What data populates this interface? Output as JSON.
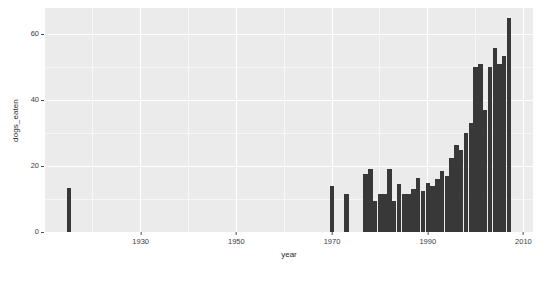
{
  "chart_data": {
    "type": "bar",
    "title": "",
    "subtitle": "",
    "xlabel": "year",
    "ylabel": "dogs_eaten",
    "xlim": [
      1910,
      2012
    ],
    "ylim": [
      0,
      68
    ],
    "grid": true,
    "legend": null,
    "panel_background": "#ebebeb",
    "bar_color": "#383838",
    "gridline_color": "#ffffff",
    "xticks": [
      1930,
      1950,
      1970,
      1990,
      2010
    ],
    "xtick_labels": [
      "1930",
      "1950",
      "1970",
      "1990",
      "2010"
    ],
    "yticks": [
      0,
      20,
      40,
      60
    ],
    "ytick_labels": [
      "0",
      "20",
      "40",
      "60"
    ],
    "x": [
      1915,
      1970,
      1973,
      1977,
      1978,
      1979,
      1980,
      1981,
      1982,
      1983,
      1984,
      1985,
      1986,
      1987,
      1988,
      1989,
      1990,
      1991,
      1992,
      1993,
      1994,
      1995,
      1996,
      1997,
      1998,
      1999,
      2000,
      2001,
      2002,
      2003,
      2004,
      2005,
      2006,
      2007
    ],
    "values": [
      13.5,
      14.0,
      11.5,
      17.5,
      19.0,
      9.5,
      11.5,
      11.5,
      19.0,
      9.5,
      14.5,
      11.5,
      11.5,
      13.0,
      16.5,
      12.5,
      15.0,
      14.0,
      16.0,
      18.5,
      17.0,
      22.5,
      26.5,
      25.0,
      30.0,
      33.0,
      50.0,
      51.0,
      37.0,
      50.0,
      56.0,
      51.0,
      53.5,
      65.0
    ],
    "categories": [
      "1915",
      "1970",
      "1973",
      "1977",
      "1978",
      "1979",
      "1980",
      "1981",
      "1982",
      "1983",
      "1984",
      "1985",
      "1986",
      "1987",
      "1988",
      "1989",
      "1990",
      "1991",
      "1992",
      "1993",
      "1994",
      "1995",
      "1996",
      "1997",
      "1998",
      "1999",
      "2000",
      "2001",
      "2002",
      "2003",
      "2004",
      "2005",
      "2006",
      "2007"
    ]
  }
}
